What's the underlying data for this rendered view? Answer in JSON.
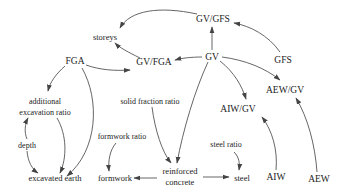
{
  "diagram": {
    "type": "causal-graph",
    "nodes": [
      {
        "id": "gv_gfs",
        "label": "GV/GFS",
        "x": 213,
        "y": 19,
        "size": 9.5
      },
      {
        "id": "storeys",
        "label": "storeys",
        "x": 105,
        "y": 37,
        "size": 8.5
      },
      {
        "id": "fga",
        "label": "FGA",
        "x": 75,
        "y": 61,
        "size": 9.5
      },
      {
        "id": "gv_fga",
        "label": "GV/FGA",
        "x": 155,
        "y": 62,
        "size": 9.5
      },
      {
        "id": "gv",
        "label": "GV",
        "x": 211,
        "y": 57,
        "size": 9.5
      },
      {
        "id": "gfs",
        "label": "GFS",
        "x": 283,
        "y": 60,
        "size": 9.5
      },
      {
        "id": "aew_gv",
        "label": "AEW/GV",
        "x": 286,
        "y": 90,
        "size": 9.5
      },
      {
        "id": "additional_excavation_ratio_1",
        "label": "additional",
        "x": 46,
        "y": 102,
        "size": 8
      },
      {
        "id": "additional_excavation_ratio_2",
        "label": "excavation ratio",
        "x": 46,
        "y": 113,
        "size": 8
      },
      {
        "id": "solid_fraction_ratio",
        "label": "solid fraction ratio",
        "x": 150,
        "y": 103,
        "size": 8
      },
      {
        "id": "aiw_gv",
        "label": "AIW/GV",
        "x": 238,
        "y": 110,
        "size": 9.5
      },
      {
        "id": "depth",
        "label": "depth",
        "x": 27,
        "y": 146,
        "size": 8
      },
      {
        "id": "formwork_ratio",
        "label": "formwork ratio",
        "x": 122,
        "y": 137,
        "size": 8
      },
      {
        "id": "steel_ratio",
        "label": "steel ratio",
        "x": 277,
        "y": 146,
        "size": 8
      },
      {
        "id": "excavated_earth",
        "label": "excavated  earth",
        "x": 55,
        "y": 181,
        "size": 8.5
      },
      {
        "id": "formwork",
        "label": "formwork",
        "x": 116,
        "y": 181,
        "size": 8.5
      },
      {
        "id": "reinforced_concrete_1",
        "label": "reinforced",
        "x": 180,
        "y": 173,
        "size": 8.5
      },
      {
        "id": "reinforced_concrete_2",
        "label": "concrete",
        "x": 180,
        "y": 184,
        "size": 8.5
      },
      {
        "id": "steel",
        "label": "steel",
        "x": 242,
        "y": 180,
        "size": 8.5
      },
      {
        "id": "aiw",
        "label": "AIW",
        "x": 272,
        "y": 180,
        "size": 9.5
      },
      {
        "id": "aew",
        "label": "AEW",
        "x": 314,
        "y": 182,
        "size": 9.5
      }
    ],
    "edges": [
      {
        "from": "GV/GFS",
        "to": "storeys"
      },
      {
        "from": "GV",
        "to": "GV/GFS"
      },
      {
        "from": "GFS",
        "to": "GV/GFS"
      },
      {
        "from": "GV/FGA",
        "to": "storeys"
      },
      {
        "from": "GV",
        "to": "GV/FGA"
      },
      {
        "from": "FGA",
        "to": "GV/FGA"
      },
      {
        "from": "GV",
        "to": "AEW/GV"
      },
      {
        "from": "GV",
        "to": "AIW/GV"
      },
      {
        "from": "GV",
        "to": "reinforced concrete"
      },
      {
        "from": "FGA",
        "to": "additional excavation ratio"
      },
      {
        "from": "FGA",
        "to": "excavated earth"
      },
      {
        "from": "additional excavation ratio",
        "to": "excavated earth"
      },
      {
        "from": "depth",
        "to": "additional excavation ratio"
      },
      {
        "from": "depth",
        "to": "excavated earth"
      },
      {
        "from": "solid fraction ratio",
        "to": "reinforced concrete"
      },
      {
        "from": "formwork ratio",
        "to": "formwork"
      },
      {
        "from": "reinforced concrete",
        "to": "formwork"
      },
      {
        "from": "reinforced concrete",
        "to": "steel"
      },
      {
        "from": "steel ratio",
        "to": "steel"
      },
      {
        "from": "AIW",
        "to": "AIW/GV"
      },
      {
        "from": "AEW",
        "to": "AEW/GV"
      }
    ]
  },
  "labels": {
    "gv_gfs": "GV/GFS",
    "storeys": "storeys",
    "fga": "FGA",
    "gv_fga": "GV/FGA",
    "gv": "GV",
    "gfs": "GFS",
    "aew_gv": "AEW/GV",
    "additional": "additional",
    "excavation_ratio": "excavation ratio",
    "solid_fraction_ratio": "solid fraction ratio",
    "aiw_gv": "AIW/GV",
    "depth": "depth",
    "formwork_ratio": "formwork ratio",
    "steel_ratio": "steel ratio",
    "excavated_earth": "excavated  earth",
    "formwork": "formwork",
    "reinforced": "reinforced",
    "concrete": "concrete",
    "steel": "steel",
    "aiw": "AIW",
    "aew": "AEW"
  },
  "colors": {
    "text": "#222222",
    "edge": "#555555",
    "background": "#ffffff"
  }
}
